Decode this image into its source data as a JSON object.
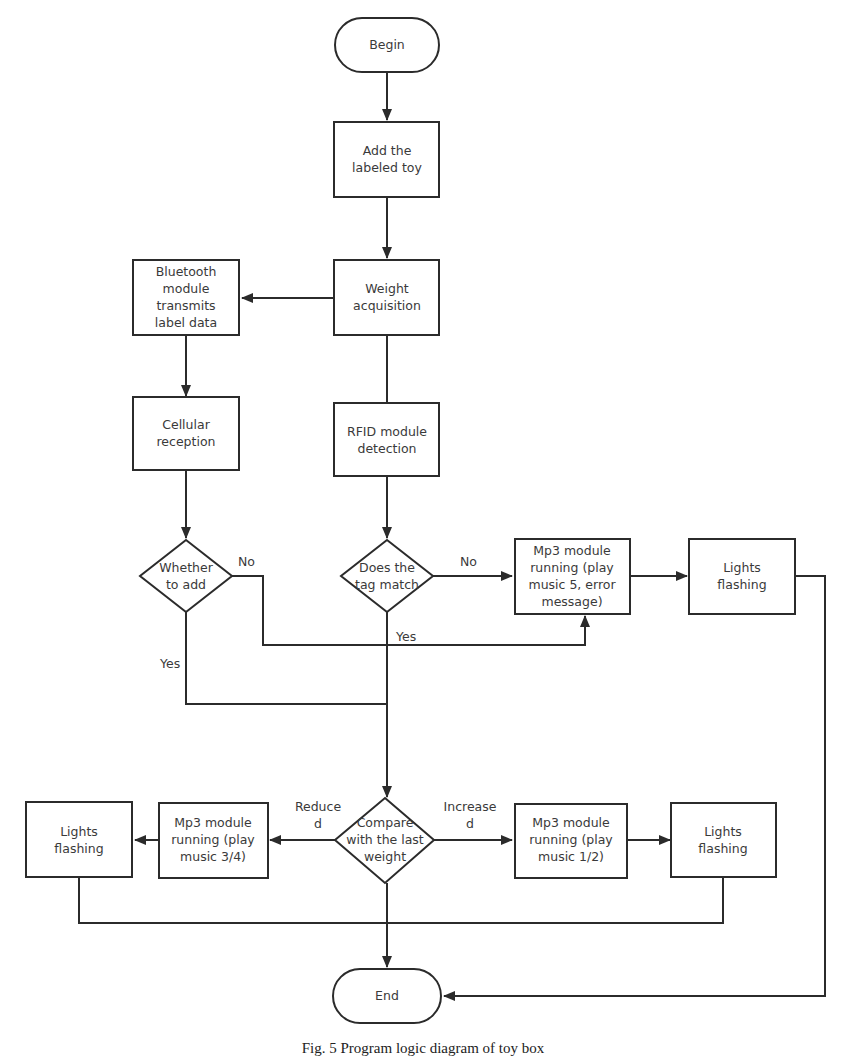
{
  "nodes": {
    "begin": {
      "lines": [
        "Begin"
      ]
    },
    "add_toy": {
      "lines": [
        "Add the",
        "labeled toy"
      ]
    },
    "weight_acq": {
      "lines": [
        "Weight",
        "acquisition"
      ]
    },
    "bluetooth": {
      "lines": [
        "Bluetooth",
        "module",
        "transmits",
        "label data"
      ]
    },
    "cellular": {
      "lines": [
        "Cellular",
        "reception"
      ]
    },
    "rfid": {
      "lines": [
        "RFID module",
        "detection"
      ]
    },
    "whether_add": {
      "lines": [
        "Whether",
        "to add"
      ]
    },
    "tag_match": {
      "lines": [
        "Does the",
        "tag match"
      ]
    },
    "mp3_error": {
      "lines": [
        "Mp3 module",
        "running (play",
        "music 5, error",
        "message)"
      ]
    },
    "lights_top": {
      "lines": [
        "Lights",
        "flashing"
      ]
    },
    "compare": {
      "lines": [
        "Compare",
        "with the last",
        "weight"
      ]
    },
    "mp3_reduced": {
      "lines": [
        "Mp3 module",
        "running (play",
        "music 3/4)"
      ]
    },
    "lights_left": {
      "lines": [
        "Lights",
        "flashing"
      ]
    },
    "mp3_increased": {
      "lines": [
        "Mp3 module",
        "running (play",
        "music 1/2)"
      ]
    },
    "lights_right": {
      "lines": [
        "Lights",
        "flashing"
      ]
    },
    "end": {
      "lines": [
        "End"
      ]
    }
  },
  "edge_labels": {
    "whether_no": "No",
    "whether_yes": "Yes",
    "tag_no": "No",
    "tag_yes": "Yes",
    "reduced": [
      "Reduce",
      "d"
    ],
    "increased": [
      "Increase",
      "d"
    ]
  },
  "caption": "Fig. 5  Program logic diagram of toy box"
}
